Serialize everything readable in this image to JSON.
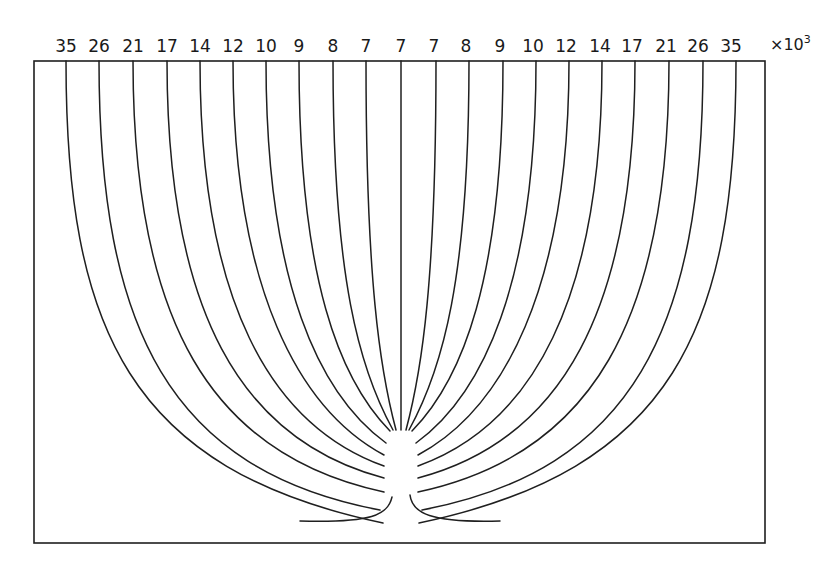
{
  "figure": {
    "multiplier": "×10",
    "multiplier_exp": "3",
    "frame": {
      "left": 34,
      "top": 61,
      "right": 765,
      "bottom": 543
    },
    "line_color": "#1f1f1f",
    "labels": [
      "35",
      "26",
      "21",
      "17",
      "14",
      "12",
      "10",
      "9",
      "8",
      "7",
      "7",
      "7",
      "8",
      "9",
      "10",
      "12",
      "14",
      "17",
      "21",
      "26",
      "35"
    ],
    "top_x": [
      66,
      99,
      133,
      167,
      200,
      233,
      266,
      299,
      333,
      366,
      401,
      434,
      466,
      500,
      533,
      566,
      600,
      632,
      666,
      698,
      731
    ],
    "left_lines": [
      {
        "x": 66,
        "c1y": 330,
        "mid": [
          130,
          470
        ],
        "end": [
          383,
          523
        ]
      },
      {
        "x": 99,
        "c1y": 330,
        "mid": [
          170,
          470
        ],
        "end": [
          380,
          510
        ]
      },
      {
        "x": 133,
        "c1y": 320,
        "mid": [
          210,
          455
        ],
        "end": [
          384,
          492
        ]
      },
      {
        "x": 167,
        "c1y": 310,
        "mid": [
          240,
          440
        ],
        "end": [
          384,
          478
        ]
      },
      {
        "x": 200,
        "c1y": 300,
        "mid": [
          270,
          425
        ],
        "end": [
          384,
          466
        ]
      },
      {
        "x": 233,
        "c1y": 290,
        "mid": [
          300,
          410
        ],
        "end": [
          384,
          455
        ]
      },
      {
        "x": 266,
        "c1y": 285,
        "mid": [
          320,
          395
        ],
        "end": [
          386,
          443
        ]
      },
      {
        "x": 299,
        "c1y": 280,
        "mid": [
          340,
          380
        ],
        "end": [
          390,
          431
        ]
      },
      {
        "x": 333,
        "c1y": 280,
        "mid": [
          360,
          370
        ],
        "end": [
          393,
          430
        ]
      },
      {
        "x": 366,
        "c1y": 280,
        "mid": [
          380,
          370
        ],
        "end": [
          396,
          430
        ]
      }
    ],
    "center_line": {
      "x": 401,
      "end_y": 430
    },
    "inner_hooks": {
      "left": {
        "from": [
          392,
          497
        ],
        "to": [
          300,
          523
        ]
      },
      "right": {
        "from": [
          410,
          495
        ],
        "to": [
          500,
          523
        ]
      }
    }
  }
}
